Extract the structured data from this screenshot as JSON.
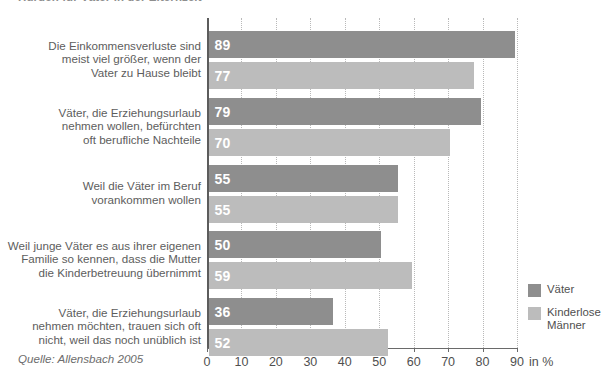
{
  "chart_data": {
    "type": "bar",
    "orientation": "horizontal",
    "title": "Hürden für Väter in der Elternzeit",
    "categories": [
      "Die Einkommensverluste sind\nmeist viel größer, wenn der\nVater zu Hause bleibt",
      "Väter, die Erziehungsurlaub\nnehmen wollen, befürchten\noft berufliche Nachteile",
      "Weil die Väter im Beruf\nvorankommen wollen",
      "Weil junge Väter es aus ihrer eigenen\nFamilie so kennen, dass die Mutter\ndie Kinderbetreuung übernimmt",
      "Väter, die Erziehungsurlaub\nnehmen möchten, trauen sich oft\nnicht, weil das noch unüblich ist"
    ],
    "series": [
      {
        "name": "Väter",
        "color": "#8e8e8e",
        "values": [
          89,
          79,
          55,
          50,
          36
        ]
      },
      {
        "name": "Kinderlose\nMänner",
        "color": "#bcbcbc",
        "values": [
          77,
          70,
          55,
          59,
          52
        ]
      }
    ],
    "xlabel": "in %",
    "ylabel": "",
    "xlim": [
      0,
      90
    ],
    "xticks": [
      0,
      10,
      20,
      30,
      40,
      50,
      60,
      70,
      80,
      90
    ],
    "xtick_labels": [
      "0",
      "10",
      "20",
      "30",
      "40",
      "50",
      "60",
      "70",
      "80",
      "90"
    ],
    "grid": true,
    "legend_position": "right",
    "source": "Quelle: Allensbach 2005"
  },
  "legend": {
    "items": [
      {
        "label": "Väter",
        "color": "#8e8e8e"
      },
      {
        "label": "Kinderlose\nMänner",
        "color": "#bcbcbc"
      }
    ]
  },
  "footer": {
    "source": "Quelle: Allensbach 2005"
  },
  "axis": {
    "unit_label": "in %"
  }
}
